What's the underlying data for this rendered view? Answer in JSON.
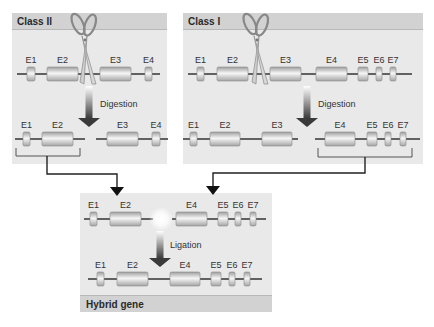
{
  "colors": {
    "panel_bg": "#e9e9e9",
    "panel_header": "#d2d2d2",
    "line": "#333333",
    "exon_light": "#f4f4f4",
    "exon_dark": "#a9a9a9",
    "connector": "#222222"
  },
  "panels": {
    "class2": {
      "title": "Class II",
      "x": 12,
      "y": 13,
      "w": 155,
      "h": 151
    },
    "class1": {
      "title": "Class I",
      "x": 183,
      "y": 13,
      "w": 240,
      "h": 151
    },
    "hybrid": {
      "title": "Hybrid gene",
      "x": 80,
      "y": 193,
      "w": 192,
      "h": 119
    }
  },
  "steps": {
    "digestion_label": "Digestion",
    "ligation_label": "Ligation"
  },
  "genes": [
    {
      "id": "class2-intact",
      "line": [
        17,
        160
      ],
      "y": 74,
      "exons": [
        {
          "label": "E1",
          "x1": 27,
          "x2": 35
        },
        {
          "label": "E2",
          "x1": 47,
          "x2": 78
        },
        {
          "label": "E3",
          "x1": 100,
          "x2": 131
        },
        {
          "label": "E4",
          "x1": 145,
          "x2": 152
        }
      ]
    },
    {
      "id": "class2-frag-left",
      "line": [
        15,
        85
      ],
      "y": 139,
      "exons": [
        {
          "label": "E1",
          "x1": 23,
          "x2": 30
        },
        {
          "label": "E2",
          "x1": 42,
          "x2": 73
        }
      ]
    },
    {
      "id": "class2-frag-right",
      "line": [
        96,
        168
      ],
      "y": 139,
      "exons": [
        {
          "label": "E3",
          "x1": 107,
          "x2": 138
        },
        {
          "label": "E4",
          "x1": 152,
          "x2": 160
        }
      ]
    },
    {
      "id": "class1-intact",
      "line": [
        188,
        412
      ],
      "y": 74,
      "exons": [
        {
          "label": "E1",
          "x1": 197,
          "x2": 204
        },
        {
          "label": "E2",
          "x1": 217,
          "x2": 248
        },
        {
          "label": "E3",
          "x1": 270,
          "x2": 301
        },
        {
          "label": "E4",
          "x1": 316,
          "x2": 347
        },
        {
          "label": "E5",
          "x1": 358,
          "x2": 368
        },
        {
          "label": "E6",
          "x1": 376,
          "x2": 382
        },
        {
          "label": "E7",
          "x1": 390,
          "x2": 396
        }
      ]
    },
    {
      "id": "class1-frag-left",
      "line": [
        183,
        298
      ],
      "y": 139,
      "exons": [
        {
          "label": "E1",
          "x1": 190,
          "x2": 197
        },
        {
          "label": "E2",
          "x1": 210,
          "x2": 240
        },
        {
          "label": "E3",
          "x1": 262,
          "x2": 292
        }
      ]
    },
    {
      "id": "class1-frag-right",
      "line": [
        315,
        420
      ],
      "y": 139,
      "exons": [
        {
          "label": "E4",
          "x1": 325,
          "x2": 355
        },
        {
          "label": "E5",
          "x1": 367,
          "x2": 377
        },
        {
          "label": "E6",
          "x1": 385,
          "x2": 391
        },
        {
          "label": "E7",
          "x1": 400,
          "x2": 406
        }
      ]
    },
    {
      "id": "hybrid-pre-left",
      "line": [
        84,
        153
      ],
      "y": 219,
      "exons": [
        {
          "label": "E1",
          "x1": 90,
          "x2": 97
        },
        {
          "label": "E2",
          "x1": 110,
          "x2": 141
        }
      ]
    },
    {
      "id": "hybrid-pre-right",
      "line": [
        172,
        266
      ],
      "y": 219,
      "exons": [
        {
          "label": "E4",
          "x1": 176,
          "x2": 207
        },
        {
          "label": "E5",
          "x1": 218,
          "x2": 228
        },
        {
          "label": "E6",
          "x1": 235,
          "x2": 241
        },
        {
          "label": "E7",
          "x1": 250,
          "x2": 256
        }
      ]
    },
    {
      "id": "hybrid-final",
      "line": [
        88,
        262
      ],
      "y": 279,
      "exons": [
        {
          "label": "E1",
          "x1": 97,
          "x2": 104
        },
        {
          "label": "E2",
          "x1": 117,
          "x2": 148
        },
        {
          "label": "E4",
          "x1": 170,
          "x2": 200
        },
        {
          "label": "E5",
          "x1": 211,
          "x2": 221
        },
        {
          "label": "E6",
          "x1": 229,
          "x2": 235
        },
        {
          "label": "E7",
          "x1": 244,
          "x2": 250
        }
      ]
    }
  ],
  "arrows": [
    {
      "id": "class2-digestion",
      "x": 89,
      "y1": 86,
      "y2": 127,
      "label_key": "digestion_label",
      "label_x": 100,
      "label_y": 107
    },
    {
      "id": "class1-digestion",
      "x": 307,
      "y1": 86,
      "y2": 127,
      "label_key": "digestion_label",
      "label_x": 318,
      "label_y": 107
    },
    {
      "id": "hybrid-ligation",
      "x": 160,
      "y1": 231,
      "y2": 267,
      "label_key": "ligation_label",
      "label_x": 170,
      "label_y": 248
    }
  ],
  "scissors": [
    {
      "id": "class2-scissors",
      "x": 84,
      "y": 58
    },
    {
      "id": "class1-scissors",
      "x": 256,
      "y": 58
    }
  ],
  "brackets": [
    {
      "id": "class2-bracket",
      "x1": 16,
      "x2": 80,
      "y1": 148,
      "y2": 156,
      "stem_x": 47,
      "path": [
        [
          47,
          156
        ],
        [
          47,
          174
        ],
        [
          117,
          174
        ],
        [
          117,
          189
        ]
      ],
      "tip": [
        117,
        196
      ]
    },
    {
      "id": "class1-bracket",
      "x1": 318,
      "x2": 412,
      "y1": 148,
      "y2": 157,
      "stem_x": 365,
      "path": [
        [
          365,
          157
        ],
        [
          365,
          173
        ],
        [
          213,
          173
        ],
        [
          213,
          188
        ]
      ],
      "tip": [
        213,
        195
      ]
    }
  ],
  "ligation_glow": {
    "x": 161,
    "y": 219
  }
}
